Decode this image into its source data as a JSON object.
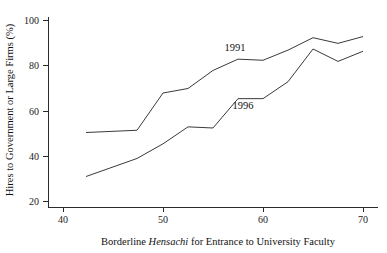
{
  "chart_data": {
    "type": "line",
    "title": "",
    "xlabel": "Borderline Hensachi for Entrance to University Faculty",
    "xlabel_parts": [
      {
        "text": "Borderline ",
        "italic": false
      },
      {
        "text": "Hensachi",
        "italic": true
      },
      {
        "text": " for Entrance to University Faculty",
        "italic": false
      }
    ],
    "ylabel": "Hires to Government or Large Firms (%)",
    "xlim": [
      38.5,
      71.5
    ],
    "ylim": [
      17.5,
      103
    ],
    "xticks": [
      40,
      50,
      60,
      70
    ],
    "xtick_labels": [
      "40",
      "50",
      "60",
      "70"
    ],
    "yticks": [
      20,
      40,
      60,
      80,
      100
    ],
    "ytick_labels": [
      "20",
      "40",
      "60",
      "80",
      "100"
    ],
    "grid": false,
    "legend_position": "inline-annotations",
    "line_color": "#3a3a3a",
    "axis_color": "#2b2b2b",
    "background_color": "#ffffff",
    "series": [
      {
        "name": "1991",
        "label_x": 57.2,
        "label_y": 86.5,
        "x": [
          42.3,
          47.4,
          50.0,
          52.5,
          55.0,
          57.5,
          60.0,
          62.5,
          65.0,
          67.5,
          70.0
        ],
        "values": [
          50.5,
          51.5,
          68.0,
          70.0,
          78.0,
          83.0,
          82.5,
          87.0,
          92.5,
          90.0,
          93.0
        ]
      },
      {
        "name": "1996",
        "label_x": 58.0,
        "label_y": 61.0,
        "x": [
          42.3,
          47.4,
          50.0,
          52.5,
          55.0,
          57.5,
          60.0,
          62.5,
          65.0,
          67.5,
          70.0
        ],
        "values": [
          31.0,
          39.0,
          45.5,
          53.0,
          52.5,
          65.5,
          65.5,
          73.0,
          87.5,
          82.0,
          86.5
        ]
      }
    ]
  }
}
